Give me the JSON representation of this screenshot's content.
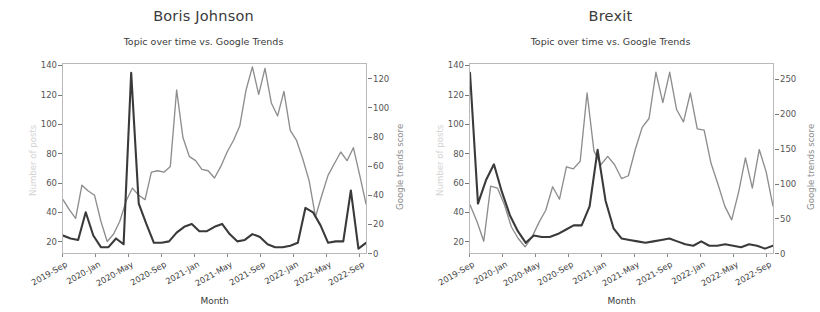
{
  "figure": {
    "width": 814,
    "height": 312,
    "background": "#ffffff",
    "colors": {
      "posts_line": "#3a3a3a",
      "trends_line": "#8d8d8d",
      "axis": "#b9b9b9",
      "text": "#3b3b3b"
    }
  },
  "chart_data": [
    {
      "type": "line",
      "title": "Boris Johnson",
      "subtitle": "Topic over time vs. Google Trends",
      "xlabel": "Month",
      "ylabel": "Number of posts",
      "y2label": "Google trends score",
      "grid": false,
      "legend": "none",
      "xtick_labels": [
        "2019-Sep",
        "2020-Jan",
        "2020-May",
        "2020-Sep",
        "2021-Jan",
        "2021-May",
        "2021-Sep",
        "2022-Jan",
        "2022-May",
        "2022-Sep"
      ],
      "x": [
        "2019-Sep",
        "2019-Oct",
        "2019-Nov",
        "2019-Dec",
        "2020-Jan",
        "2020-Feb",
        "2020-Mar",
        "2020-Apr",
        "2020-May",
        "2020-Jun",
        "2020-Jul",
        "2020-Aug",
        "2020-Sep",
        "2020-Oct",
        "2020-Nov",
        "2020-Dec",
        "2021-Jan",
        "2021-Feb",
        "2021-Mar",
        "2021-Apr",
        "2021-May",
        "2021-Jun",
        "2021-Jul",
        "2021-Aug",
        "2021-Sep",
        "2021-Oct",
        "2021-Nov",
        "2021-Dec",
        "2022-Jan",
        "2022-Feb",
        "2022-Mar",
        "2022-Apr",
        "2022-May",
        "2022-Jun",
        "2022-Jul",
        "2022-Aug",
        "2022-Sep",
        "2022-Oct"
      ],
      "ylim": [
        12,
        142
      ],
      "ytick_values": [
        20,
        40,
        60,
        80,
        100,
        120,
        140
      ],
      "y2lim": [
        0,
        131
      ],
      "y2tick_values": [
        0,
        20,
        40,
        60,
        80,
        100,
        120
      ],
      "series": [
        {
          "name": "Number of posts",
          "axis": "left",
          "color": "#3a3a3a",
          "values": [
            24,
            22,
            21,
            40,
            24,
            16,
            16,
            22,
            18,
            136,
            46,
            32,
            19,
            19,
            20,
            26,
            30,
            32,
            27,
            27,
            30,
            32,
            25,
            20,
            21,
            25,
            23,
            18,
            16,
            16,
            17,
            19,
            43,
            40,
            31,
            19,
            20,
            20,
            55,
            15,
            19
          ]
        },
        {
          "name": "Google trends score",
          "axis": "right",
          "color": "#8d8d8d",
          "values": [
            37,
            30,
            24,
            47,
            43,
            40,
            22,
            8,
            13,
            22,
            36,
            45,
            40,
            37,
            56,
            57,
            56,
            60,
            113,
            80,
            67,
            64,
            58,
            57,
            52,
            60,
            70,
            78,
            88,
            113,
            129,
            110,
            128,
            104,
            95,
            112,
            85,
            78,
            65,
            50,
            25,
            40,
            54,
            62,
            70,
            64,
            73,
            54,
            34
          ]
        }
      ]
    },
    {
      "type": "line",
      "title": "Brexit",
      "subtitle": "Topic over time vs. Google Trends",
      "xlabel": "Month",
      "ylabel": "Number of posts",
      "y2label": "Google trends score",
      "grid": false,
      "legend": "none",
      "xtick_labels": [
        "2019-Sep",
        "2020-Jan",
        "2020-May",
        "2020-Sep",
        "2021-Jan",
        "2021-May",
        "2021-Sep",
        "2022-Jan",
        "2022-May",
        "2022-Sep"
      ],
      "x": [
        "2019-Sep",
        "2019-Oct",
        "2019-Nov",
        "2019-Dec",
        "2020-Jan",
        "2020-Feb",
        "2020-Mar",
        "2020-Apr",
        "2020-May",
        "2020-Jun",
        "2020-Jul",
        "2020-Aug",
        "2020-Sep",
        "2020-Oct",
        "2020-Nov",
        "2020-Dec",
        "2021-Jan",
        "2021-Feb",
        "2021-Mar",
        "2021-Apr",
        "2021-May",
        "2021-Jun",
        "2021-Jul",
        "2021-Aug",
        "2021-Sep",
        "2021-Oct",
        "2021-Nov",
        "2021-Dec",
        "2022-Jan",
        "2022-Feb",
        "2022-Mar",
        "2022-Apr",
        "2022-May",
        "2022-Jun",
        "2022-Jul",
        "2022-Aug",
        "2022-Sep",
        "2022-Oct"
      ],
      "ylim": [
        12,
        142
      ],
      "ytick_values": [
        20,
        40,
        60,
        80,
        100,
        120,
        140
      ],
      "y2lim": [
        0,
        274
      ],
      "y2tick_values": [
        0,
        50,
        100,
        150,
        200,
        250
      ],
      "series": [
        {
          "name": "Number of posts",
          "axis": "left",
          "color": "#3a3a3a",
          "values": [
            136,
            46,
            62,
            73,
            54,
            38,
            27,
            19,
            24,
            23,
            23,
            25,
            28,
            31,
            31,
            44,
            83,
            48,
            29,
            22,
            21,
            20,
            19,
            20,
            21,
            22,
            20,
            18,
            17,
            20,
            17,
            17,
            18,
            17,
            16,
            18,
            17,
            15,
            17
          ]
        },
        {
          "name": "Google trends score",
          "axis": "right",
          "color": "#8d8d8d",
          "values": [
            70,
            46,
            17,
            97,
            94,
            70,
            38,
            21,
            9,
            23,
            44,
            62,
            96,
            78,
            125,
            122,
            133,
            232,
            148,
            128,
            140,
            128,
            108,
            112,
            150,
            182,
            195,
            262,
            218,
            262,
            208,
            190,
            232,
            180,
            178,
            130,
            100,
            68,
            48,
            88,
            138,
            94,
            150,
            118,
            68
          ]
        }
      ]
    }
  ]
}
